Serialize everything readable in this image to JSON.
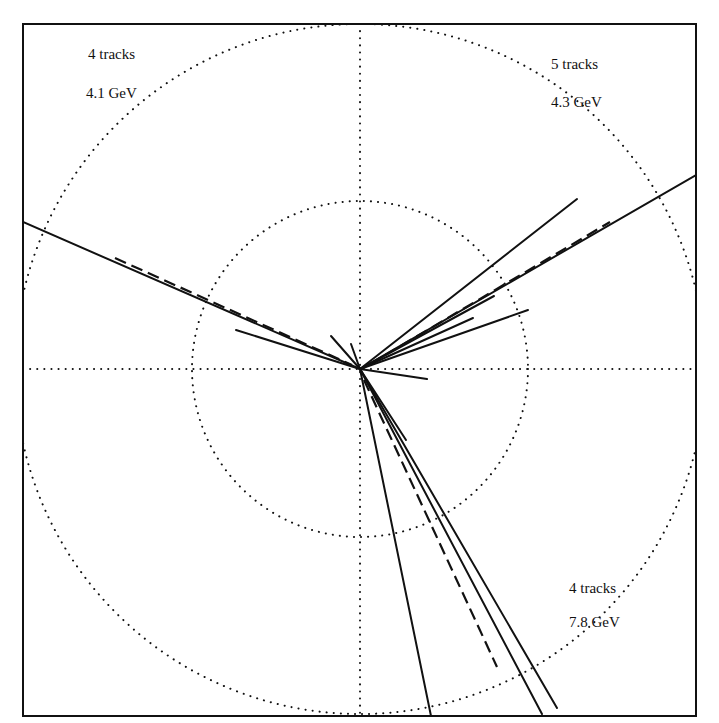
{
  "figure": {
    "width": 719,
    "height": 723,
    "frame": {
      "x1": 23,
      "y1": 24,
      "x2": 696,
      "y2": 716
    },
    "center": {
      "x": 360,
      "y": 369
    },
    "colors": {
      "ink": "#111111",
      "background": "#ffffff"
    },
    "circles": [
      {
        "name": "inner-circle",
        "r": 168
      },
      {
        "name": "outer-circle",
        "r": 345
      }
    ],
    "axes": {
      "style": "dotted",
      "horizontal": true,
      "vertical": true
    }
  },
  "jets": [
    {
      "name": "jet-upper-left",
      "tracks_label": "4 tracks",
      "energy_label": "4.1 GeV",
      "label_pos": {
        "x": 88,
        "y": 47
      },
      "tracks": [
        {
          "x": 23,
          "y": 222,
          "style": "solid"
        },
        {
          "x": 236,
          "y": 330,
          "style": "solid"
        },
        {
          "x": 331,
          "y": 336,
          "style": "solid"
        },
        {
          "x": 351,
          "y": 344,
          "style": "solid"
        }
      ],
      "jet_axis": {
        "x1": 115,
        "y1": 258,
        "x2": 352,
        "y2": 365,
        "style": "dashed"
      }
    },
    {
      "name": "jet-upper-right",
      "tracks_label": "5 tracks",
      "energy_label": "4.3 GeV",
      "label_pos": {
        "x": 551,
        "y": 58
      },
      "tracks": [
        {
          "x": 577,
          "y": 199,
          "style": "solid"
        },
        {
          "x": 696,
          "y": 175,
          "style": "solid"
        },
        {
          "x": 494,
          "y": 296,
          "style": "solid"
        },
        {
          "x": 473,
          "y": 318,
          "style": "solid"
        },
        {
          "x": 528,
          "y": 310,
          "style": "solid"
        },
        {
          "x": 427,
          "y": 379,
          "style": "solid"
        }
      ],
      "jet_axis": {
        "x1": 370,
        "y1": 364,
        "x2": 610,
        "y2": 222,
        "style": "dashed"
      }
    },
    {
      "name": "jet-lower",
      "tracks_label": "4 tracks",
      "energy_label": "7.8 GeV",
      "label_pos": {
        "x": 569,
        "y": 581
      },
      "tracks": [
        {
          "x": 431,
          "y": 716,
          "style": "solid"
        },
        {
          "x": 542,
          "y": 714,
          "style": "solid"
        },
        {
          "x": 557,
          "y": 708,
          "style": "solid"
        },
        {
          "x": 406,
          "y": 440,
          "style": "solid"
        }
      ],
      "jet_axis": {
        "x1": 364,
        "y1": 380,
        "x2": 497,
        "y2": 667,
        "style": "dashed"
      }
    }
  ]
}
